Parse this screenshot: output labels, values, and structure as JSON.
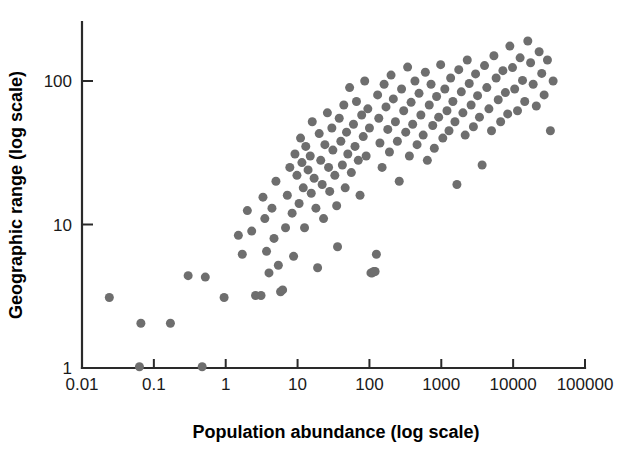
{
  "chart_data": {
    "type": "scatter",
    "title": "",
    "xlabel": "Population abundance (log scale)",
    "ylabel": "Geographic range (log scale)",
    "xscale": "log",
    "yscale": "log",
    "xlim": [
      0.01,
      100000
    ],
    "ylim": [
      1,
      250
    ],
    "xticks": [
      0.01,
      0.1,
      1,
      10,
      100,
      1000,
      10000,
      100000
    ],
    "xtick_labels": [
      "0.01",
      "0.1",
      "1",
      "10",
      "100",
      "1000",
      "10000",
      "100000"
    ],
    "yticks": [
      1,
      10,
      100
    ],
    "ytick_labels": [
      "1",
      "10",
      "100"
    ],
    "grid": false,
    "legend": null,
    "marker": {
      "shape": "circle",
      "color": "#6e6e6e",
      "size_px": 9
    },
    "n_points": 168,
    "points": [
      [
        0.024,
        3.1
      ],
      [
        0.063,
        1.02
      ],
      [
        0.066,
        2.05
      ],
      [
        0.17,
        2.05
      ],
      [
        0.3,
        4.4
      ],
      [
        0.47,
        1.02
      ],
      [
        0.52,
        4.3
      ],
      [
        0.95,
        3.1
      ],
      [
        1.5,
        8.4
      ],
      [
        1.7,
        6.2
      ],
      [
        2.0,
        12.5
      ],
      [
        2.3,
        9.0
      ],
      [
        2.6,
        3.2
      ],
      [
        3.1,
        3.2
      ],
      [
        3.3,
        15.5
      ],
      [
        3.5,
        11.0
      ],
      [
        3.7,
        6.5
      ],
      [
        4.0,
        4.6
      ],
      [
        4.4,
        13.0
      ],
      [
        4.7,
        8.0
      ],
      [
        5.0,
        20.0
      ],
      [
        5.4,
        5.2
      ],
      [
        5.8,
        3.4
      ],
      [
        6.2,
        3.5
      ],
      [
        6.8,
        9.5
      ],
      [
        7.2,
        16.0
      ],
      [
        7.8,
        25.0
      ],
      [
        8.4,
        12.0
      ],
      [
        8.8,
        6.0
      ],
      [
        9.2,
        31.0
      ],
      [
        9.8,
        22.0
      ],
      [
        10.5,
        14.0
      ],
      [
        11.0,
        40.0
      ],
      [
        11.5,
        27.0
      ],
      [
        12.0,
        18.0
      ],
      [
        12.5,
        9.5
      ],
      [
        13.0,
        35.0
      ],
      [
        14.0,
        24.0
      ],
      [
        15.0,
        30.0
      ],
      [
        15.5,
        16.5
      ],
      [
        16.0,
        52.0
      ],
      [
        17.0,
        21.0
      ],
      [
        18.0,
        13.0
      ],
      [
        19.0,
        5.0
      ],
      [
        20.0,
        43.0
      ],
      [
        21.0,
        28.0
      ],
      [
        22.0,
        19.0
      ],
      [
        23.0,
        11.0
      ],
      [
        24.0,
        36.0
      ],
      [
        26.0,
        60.0
      ],
      [
        27.0,
        25.0
      ],
      [
        28.0,
        17.0
      ],
      [
        30.0,
        47.0
      ],
      [
        31.0,
        33.0
      ],
      [
        33.0,
        22.0
      ],
      [
        35.0,
        13.5
      ],
      [
        36.0,
        7.0
      ],
      [
        38.0,
        55.0
      ],
      [
        40.0,
        38.0
      ],
      [
        42.0,
        26.0
      ],
      [
        44.0,
        68.0
      ],
      [
        46.0,
        18.0
      ],
      [
        48.0,
        44.0
      ],
      [
        50.0,
        31.0
      ],
      [
        53.0,
        90.0
      ],
      [
        56.0,
        23.0
      ],
      [
        60.0,
        50.0
      ],
      [
        63.0,
        35.0
      ],
      [
        66.0,
        72.0
      ],
      [
        70.0,
        28.0
      ],
      [
        74.0,
        16.0
      ],
      [
        78.0,
        58.0
      ],
      [
        82.0,
        41.0
      ],
      [
        86.0,
        100.0
      ],
      [
        90.0,
        30.0
      ],
      [
        95.0,
        64.0
      ],
      [
        100.0,
        47.0
      ],
      [
        105.0,
        4.6
      ],
      [
        110.0,
        4.6
      ],
      [
        115.0,
        4.7
      ],
      [
        120.0,
        4.7
      ],
      [
        125.0,
        6.2
      ],
      [
        130.0,
        80.0
      ],
      [
        135.0,
        55.0
      ],
      [
        140.0,
        37.0
      ],
      [
        150.0,
        25.0
      ],
      [
        160.0,
        95.0
      ],
      [
        170.0,
        66.0
      ],
      [
        180.0,
        46.0
      ],
      [
        190.0,
        32.0
      ],
      [
        200.0,
        110.0
      ],
      [
        215.0,
        75.0
      ],
      [
        230.0,
        52.0
      ],
      [
        245.0,
        38.0
      ],
      [
        260.0,
        20.0
      ],
      [
        280.0,
        88.0
      ],
      [
        300.0,
        62.0
      ],
      [
        320.0,
        44.0
      ],
      [
        340.0,
        125.0
      ],
      [
        360.0,
        30.0
      ],
      [
        380.0,
        71.0
      ],
      [
        400.0,
        50.0
      ],
      [
        430.0,
        100.0
      ],
      [
        460.0,
        36.0
      ],
      [
        490.0,
        82.0
      ],
      [
        520.0,
        58.0
      ],
      [
        560.0,
        42.0
      ],
      [
        600.0,
        115.0
      ],
      [
        640.0,
        28.0
      ],
      [
        680.0,
        68.0
      ],
      [
        720.0,
        95.0
      ],
      [
        760.0,
        49.0
      ],
      [
        800.0,
        34.0
      ],
      [
        860.0,
        78.0
      ],
      [
        920.0,
        56.0
      ],
      [
        980.0,
        130.0
      ],
      [
        1050.0,
        40.0
      ],
      [
        1120.0,
        88.0
      ],
      [
        1200.0,
        62.0
      ],
      [
        1280.0,
        45.0
      ],
      [
        1350.0,
        105.0
      ],
      [
        1450.0,
        72.0
      ],
      [
        1550.0,
        52.0
      ],
      [
        1650.0,
        19.0
      ],
      [
        1750.0,
        120.0
      ],
      [
        1900.0,
        84.0
      ],
      [
        2000.0,
        60.0
      ],
      [
        2150.0,
        42.0
      ],
      [
        2300.0,
        140.0
      ],
      [
        2450.0,
        96.0
      ],
      [
        2600.0,
        68.0
      ],
      [
        2800.0,
        48.0
      ],
      [
        3000.0,
        112.0
      ],
      [
        3200.0,
        79.0
      ],
      [
        3400.0,
        56.0
      ],
      [
        3700.0,
        26.0
      ],
      [
        4000.0,
        128.0
      ],
      [
        4300.0,
        90.0
      ],
      [
        4600.0,
        64.0
      ],
      [
        5000.0,
        45.0
      ],
      [
        5400.0,
        150.0
      ],
      [
        5800.0,
        105.0
      ],
      [
        6200.0,
        74.0
      ],
      [
        6700.0,
        52.0
      ],
      [
        7200.0,
        118.0
      ],
      [
        7800.0,
        83.0
      ],
      [
        8400.0,
        59.0
      ],
      [
        9000.0,
        175.0
      ],
      [
        9800.0,
        124.0
      ],
      [
        10500.0,
        88.0
      ],
      [
        11500.0,
        62.0
      ],
      [
        12500.0,
        145.0
      ],
      [
        13500.0,
        101.0
      ],
      [
        14500.0,
        72.0
      ],
      [
        16000.0,
        190.0
      ],
      [
        17500.0,
        134.0
      ],
      [
        19000.0,
        95.0
      ],
      [
        21000.0,
        67.0
      ],
      [
        23000.0,
        160.0
      ],
      [
        25000.0,
        113.0
      ],
      [
        27000.0,
        80.0
      ],
      [
        30000.0,
        140.0
      ],
      [
        33000.0,
        45.0
      ],
      [
        36000.0,
        100.0
      ]
    ]
  },
  "figure": {
    "background_color": "#ffffff",
    "axis_color": "#2a2a2a",
    "marker_color": "#6e6e6e",
    "label_color": "#000000"
  }
}
